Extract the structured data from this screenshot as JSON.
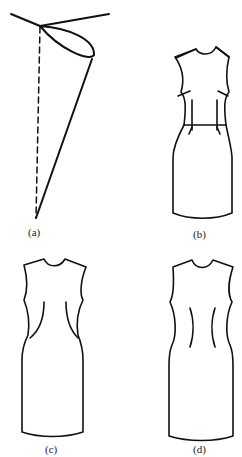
{
  "figure": {
    "panels": [
      {
        "id": "a",
        "label": "(a)",
        "description": "dart cone diagram"
      },
      {
        "id": "b",
        "label": "(b)",
        "description": "dress with waist seam and darts"
      },
      {
        "id": "c",
        "label": "(c)",
        "description": "dress with curved princess seams"
      },
      {
        "id": "d",
        "label": "(d)",
        "description": "dress with vertical fisheye darts"
      }
    ]
  },
  "colors": {
    "stroke": "#111111",
    "background": "#ffffff"
  }
}
